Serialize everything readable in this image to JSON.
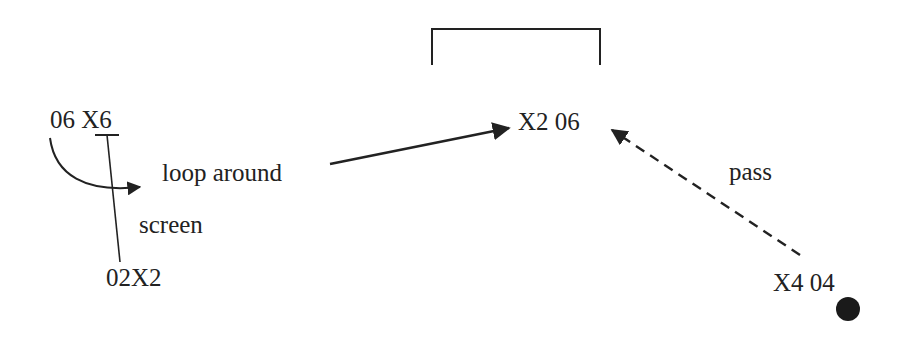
{
  "diagram": {
    "type": "basketball-play",
    "colors": {
      "stroke": "#222222",
      "text": "#222222",
      "ball": "#1a1a1a",
      "background": "#ffffff"
    },
    "basket": {
      "icon": "hoop-bracket"
    },
    "players": [
      {
        "id": "p1",
        "label": "06 X6"
      },
      {
        "id": "p2",
        "label": "02X2"
      },
      {
        "id": "p3",
        "label": "X2 06"
      },
      {
        "id": "p4",
        "label": "X4 04"
      }
    ],
    "actions": [
      {
        "id": "a1",
        "label": "loop around",
        "style": "curved-arrow"
      },
      {
        "id": "a2",
        "label": "screen",
        "style": "screen-line"
      },
      {
        "id": "a3",
        "label": "",
        "style": "solid-arrow"
      },
      {
        "id": "a4",
        "label": "pass",
        "style": "dashed-arrow"
      }
    ],
    "ball": {
      "icon": "ball-dot"
    }
  }
}
